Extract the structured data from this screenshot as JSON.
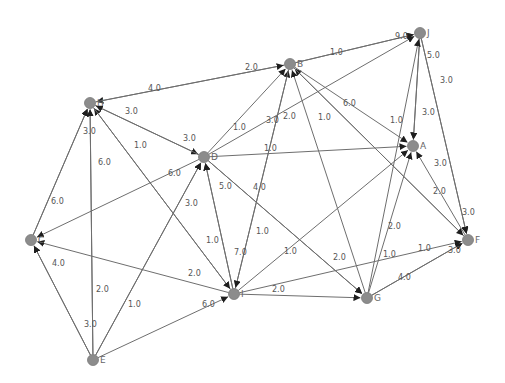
{
  "graph": {
    "title": "",
    "directed": true,
    "colors": {
      "node": "#8c8c8c",
      "edge": "#6e6e6e",
      "label": "#555555",
      "background": "#ffffff"
    },
    "nodes": [
      {
        "id": "A",
        "label": "A",
        "x": 413,
        "y": 146
      },
      {
        "id": "B",
        "label": "B",
        "x": 290,
        "y": 64
      },
      {
        "id": "C",
        "label": "C",
        "x": 31,
        "y": 240
      },
      {
        "id": "D",
        "label": "D",
        "x": 204,
        "y": 157
      },
      {
        "id": "E",
        "label": "E",
        "x": 93,
        "y": 360
      },
      {
        "id": "F",
        "label": "F",
        "x": 468,
        "y": 240
      },
      {
        "id": "G",
        "label": "G",
        "x": 367,
        "y": 298
      },
      {
        "id": "H",
        "label": "H",
        "x": 90,
        "y": 103
      },
      {
        "id": "I",
        "label": "I",
        "x": 234,
        "y": 294
      },
      {
        "id": "J",
        "label": "J",
        "x": 420,
        "y": 33
      }
    ],
    "edges": [
      {
        "from": "B",
        "to": "H",
        "weight": "4.0",
        "lx": 148,
        "ly": 91
      },
      {
        "from": "H",
        "to": "B",
        "weight": "2.0",
        "lx": 245,
        "ly": 70
      },
      {
        "from": "B",
        "to": "J",
        "weight": "1.0",
        "lx": 330,
        "ly": 55
      },
      {
        "from": "B",
        "to": "J",
        "weight": "9.0",
        "lx": 395,
        "ly": 39
      },
      {
        "from": "H",
        "to": "D",
        "weight": "3.0",
        "lx": 125,
        "ly": 114
      },
      {
        "from": "D",
        "to": "H",
        "weight": "3.0",
        "lx": 183,
        "ly": 141
      },
      {
        "from": "C",
        "to": "H",
        "weight": "3.0",
        "lx": 83,
        "ly": 134
      },
      {
        "from": "E",
        "to": "H",
        "weight": "6.0",
        "lx": 98,
        "ly": 165
      },
      {
        "from": "I",
        "to": "H",
        "weight": "1.0",
        "lx": 134,
        "ly": 148
      },
      {
        "from": "D",
        "to": "B",
        "weight": "1.0",
        "lx": 233,
        "ly": 130
      },
      {
        "from": "D",
        "to": "J",
        "weight": "3.0",
        "lx": 266,
        "ly": 123
      },
      {
        "from": "I",
        "to": "B",
        "weight": "2.0",
        "lx": 283,
        "ly": 119
      },
      {
        "from": "G",
        "to": "B",
        "weight": "1.0",
        "lx": 318,
        "ly": 120
      },
      {
        "from": "F",
        "to": "B",
        "weight": "6.0",
        "lx": 343,
        "ly": 106
      },
      {
        "from": "B",
        "to": "A",
        "weight": "1.0",
        "lx": 390,
        "ly": 123
      },
      {
        "from": "D",
        "to": "A",
        "weight": "1.0",
        "lx": 264,
        "ly": 151
      },
      {
        "from": "J",
        "to": "A",
        "weight": "5.0",
        "lx": 427,
        "ly": 58
      },
      {
        "from": "J",
        "to": "A",
        "weight": "3.0",
        "lx": 422,
        "ly": 115
      },
      {
        "from": "J",
        "to": "F",
        "weight": "3.0",
        "lx": 440,
        "ly": 83
      },
      {
        "from": "F",
        "to": "A",
        "weight": "3.0",
        "lx": 434,
        "ly": 166
      },
      {
        "from": "B",
        "to": "F",
        "weight": "2.0",
        "lx": 433,
        "ly": 194
      },
      {
        "from": "J",
        "to": "F",
        "weight": "3.0",
        "lx": 462,
        "ly": 215
      },
      {
        "from": "D",
        "to": "C",
        "weight": "6.0",
        "lx": 168,
        "ly": 176
      },
      {
        "from": "I",
        "to": "D",
        "weight": "5.0",
        "lx": 219,
        "ly": 189
      },
      {
        "from": "D",
        "to": "G",
        "weight": "4.0",
        "lx": 253,
        "ly": 190
      },
      {
        "from": "E",
        "to": "D",
        "weight": "3.0",
        "lx": 185,
        "ly": 206
      },
      {
        "from": "C",
        "to": "H",
        "weight": "6.0",
        "lx": 51,
        "ly": 204
      },
      {
        "from": "I",
        "to": "D",
        "weight": "7.0",
        "lx": 234,
        "ly": 255
      },
      {
        "from": "H",
        "to": "I",
        "weight": "1.0",
        "lx": 206,
        "ly": 243
      },
      {
        "from": "B",
        "to": "I",
        "weight": "1.0",
        "lx": 256,
        "ly": 234
      },
      {
        "from": "I",
        "to": "A",
        "weight": "1.0",
        "lx": 284,
        "ly": 254
      },
      {
        "from": "D",
        "to": "G",
        "weight": "2.0",
        "lx": 333,
        "ly": 260
      },
      {
        "from": "G",
        "to": "J",
        "weight": "2.0",
        "lx": 388,
        "ly": 229
      },
      {
        "from": "G",
        "to": "A",
        "weight": "1.0",
        "lx": 383,
        "ly": 257
      },
      {
        "from": "I",
        "to": "F",
        "weight": "1.0",
        "lx": 418,
        "ly": 251
      },
      {
        "from": "G",
        "to": "F",
        "weight": "4.0",
        "lx": 398,
        "ly": 280
      },
      {
        "from": "G",
        "to": "F",
        "weight": "3.0",
        "lx": 448,
        "ly": 253
      },
      {
        "from": "I",
        "to": "G",
        "weight": "2.0",
        "lx": 272,
        "ly": 292
      },
      {
        "from": "I",
        "to": "C",
        "weight": "2.0",
        "lx": 188,
        "ly": 276
      },
      {
        "from": "E",
        "to": "C",
        "weight": "4.0",
        "lx": 52,
        "ly": 266
      },
      {
        "from": "E",
        "to": "H",
        "weight": "2.0",
        "lx": 96,
        "ly": 292
      },
      {
        "from": "E",
        "to": "D",
        "weight": "1.0",
        "lx": 128,
        "ly": 307
      },
      {
        "from": "E",
        "to": "C",
        "weight": "3.0",
        "lx": 84,
        "ly": 327
      },
      {
        "from": "E",
        "to": "I",
        "weight": "6.0",
        "lx": 202,
        "ly": 307
      }
    ]
  }
}
